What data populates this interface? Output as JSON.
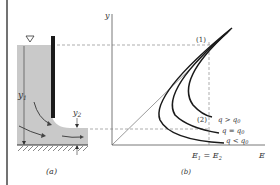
{
  "figure": {
    "panel_a": {
      "caption": "(a)",
      "label_y1": "y",
      "label_y1_sub": "1",
      "label_y2": "y",
      "label_y2_sub": "2",
      "water_surface_symbol": "▽",
      "colors": {
        "water": "#c8c8c8",
        "gate": "#1a1a1a"
      }
    },
    "panel_b": {
      "caption": "(b)",
      "axis_y_label": "y",
      "axis_x_label": "E",
      "point_1_label": "(1)",
      "point_2_label": "(2)",
      "energy_label": "E",
      "energy_label_sub1": "1",
      "energy_eq": " = ",
      "energy_label_sub2": "2",
      "curves": [
        {
          "label": "q > q",
          "sub": "0"
        },
        {
          "label": "q = q",
          "sub": "0"
        },
        {
          "label": "q < q",
          "sub": "0"
        }
      ]
    }
  }
}
